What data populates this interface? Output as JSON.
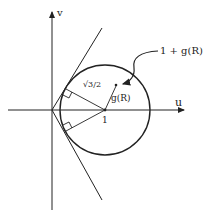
{
  "diagram": {
    "axes": {
      "x_label": "u",
      "y_label": "v"
    },
    "labels": {
      "center_tick": "1",
      "radius": "√3/2",
      "vector": "g(R)",
      "point": "1 + g(R)"
    },
    "colors": {
      "stroke": "#222222",
      "background": "#ffffff"
    },
    "geometry": {
      "origin": [
        52,
        110
      ],
      "circle_center": [
        105,
        110
      ],
      "circle_radius": 45
    }
  }
}
